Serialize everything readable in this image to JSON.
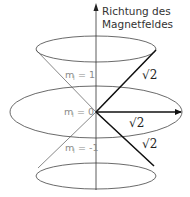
{
  "axis": {
    "label_line1": "Richtung des",
    "label_line2": "Magnetfeldes"
  },
  "states": [
    {
      "m_symbol": "m",
      "m_sub": "l",
      "m_value": "= 1",
      "vector_label": "√2"
    },
    {
      "m_symbol": "m",
      "m_sub": "l",
      "m_value": "= 0",
      "vector_label": "√2"
    },
    {
      "m_symbol": "m",
      "m_sub": "l",
      "m_value": "= -1",
      "vector_label": "√2"
    }
  ],
  "colors": {
    "line": "#333333",
    "vector": "#111111",
    "state_label": "#8a8a8a"
  }
}
